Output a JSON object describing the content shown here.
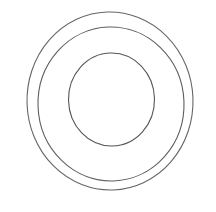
{
  "canvas": {
    "width": 216,
    "height": 212,
    "background_color": "#ffffff",
    "title": "Concentric Circles Line Drawing"
  },
  "figure": {
    "name": "concentric-circles",
    "shape_count": 3,
    "stroke_color": "#5a5a5a",
    "stroke_color_outer": "#666666",
    "stroke_color_middle": "#5e5e5e",
    "stroke_color_inner": "#555555",
    "stroke_width": 1.1,
    "fill": "none"
  },
  "shapes": [
    {
      "name": "outer-ring",
      "type": "ellipse",
      "cx": 110,
      "cy": 101,
      "rx": 83,
      "ry": 89,
      "stroke": "#666666",
      "stroke_width": 1.1,
      "rotate": -2,
      "bounds": {
        "left": 27,
        "top": 12,
        "right": 193,
        "bottom": 190
      }
    },
    {
      "name": "middle-ring",
      "type": "ellipse",
      "cx": 111,
      "cy": 104,
      "rx": 73,
      "ry": 77,
      "stroke": "#5e5e5e",
      "stroke_width": 1.1,
      "rotate": -2,
      "bounds": {
        "left": 38,
        "top": 27,
        "right": 184,
        "bottom": 181
      }
    },
    {
      "name": "inner-ring",
      "type": "ellipse",
      "cx": 111.5,
      "cy": 99.5,
      "rx": 43,
      "ry": 46.5,
      "stroke": "#555555",
      "stroke_width": 1.1,
      "rotate": -1,
      "bounds": {
        "left": 69,
        "top": 53,
        "right": 154,
        "bottom": 146
      }
    }
  ]
}
